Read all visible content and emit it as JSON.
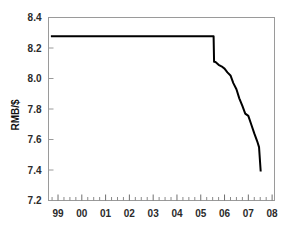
{
  "chart_data": {
    "type": "line",
    "title": "",
    "xlabel": "",
    "ylabel": "RMB/$",
    "ylim": [
      7.2,
      8.4
    ],
    "ytick_values": [
      7.2,
      7.4,
      7.6,
      7.8,
      8.0,
      8.2,
      8.4
    ],
    "ytick_labels": [
      "7.2",
      "7.4",
      "7.6",
      "7.8",
      "8.0",
      "8.2",
      "8.4"
    ],
    "xlim": [
      1998.6,
      2008.1
    ],
    "xtick_values": [
      1999,
      2000,
      2001,
      2002,
      2003,
      2004,
      2005,
      2006,
      2007,
      2008
    ],
    "xtick_labels": [
      "99",
      "00",
      "01",
      "02",
      "03",
      "04",
      "05",
      "06",
      "07",
      "08"
    ],
    "minor_ticks_per_interval": 4,
    "grid": false,
    "legend": null,
    "line_color": "#000000",
    "line_width": 2.0,
    "frame_color": "#9a9a9a",
    "series": [
      {
        "name": "RMB/$ exchange rate",
        "x": [
          1998.7,
          1999.0,
          1999.5,
          2000.0,
          2000.5,
          2001.0,
          2001.5,
          2002.0,
          2002.5,
          2003.0,
          2003.5,
          2004.0,
          2004.5,
          2004.9,
          2005.54,
          2005.56,
          2005.62,
          2005.75,
          2005.87,
          2006.0,
          2006.12,
          2006.25,
          2006.37,
          2006.5,
          2006.62,
          2006.75,
          2006.87,
          2007.0,
          2007.12,
          2007.25,
          2007.37,
          2007.45,
          2007.52
        ],
        "y": [
          8.277,
          8.277,
          8.277,
          8.277,
          8.277,
          8.277,
          8.277,
          8.277,
          8.277,
          8.277,
          8.277,
          8.277,
          8.277,
          8.277,
          8.277,
          8.11,
          8.108,
          8.09,
          8.08,
          8.065,
          8.04,
          8.02,
          7.97,
          7.93,
          7.87,
          7.82,
          7.77,
          7.755,
          7.7,
          7.64,
          7.59,
          7.55,
          7.39
        ]
      }
    ],
    "annotations": []
  },
  "axes": {
    "y_axis_title": "RMB/$"
  }
}
